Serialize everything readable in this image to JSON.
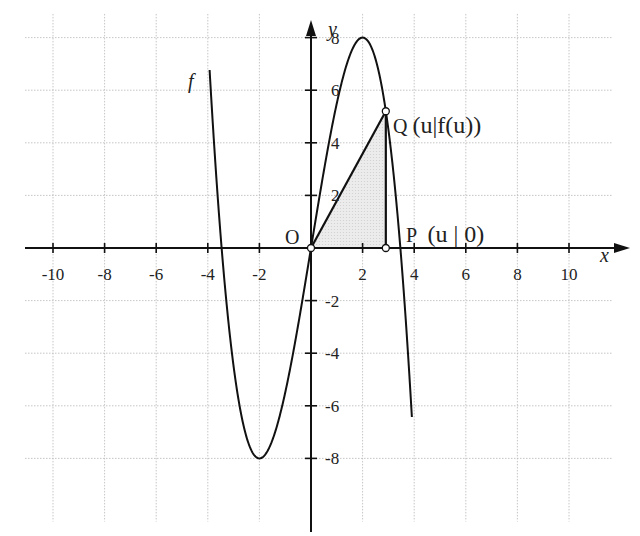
{
  "chart_data": {
    "type": "line",
    "title": "",
    "function_label": "f",
    "function_formula": "f(x) = -0.5x^3 + 6x",
    "xlabel": "x",
    "ylabel": "y",
    "xlim": [
      -11.5,
      11.5
    ],
    "ylim": [
      -10.5,
      9
    ],
    "grid": true,
    "x_ticks": [
      -10,
      -8,
      -6,
      -4,
      -2,
      2,
      4,
      6,
      8,
      10
    ],
    "y_ticks": [
      -8,
      -6,
      -4,
      -2,
      2,
      4,
      6,
      8
    ],
    "x_tick_labels": [
      "-10",
      "-8",
      "-6",
      "-4",
      "-2",
      "2",
      "4",
      "6",
      "8",
      "10"
    ],
    "y_tick_labels": [
      "-8",
      "-6",
      "-4",
      "-2",
      "2",
      "4",
      "6",
      "8"
    ],
    "series": [
      {
        "name": "f",
        "x": [
          -3.9,
          -3.46,
          -3,
          -2.5,
          -2,
          -1.5,
          -1,
          -0.5,
          0,
          0.5,
          1,
          1.5,
          2,
          2.5,
          3,
          3.46,
          3.9
        ],
        "values": [
          6.26,
          0,
          -4.5,
          -7.19,
          -8,
          -6.31,
          -5.5,
          -2.94,
          0,
          2.94,
          5.5,
          7.31,
          8,
          7.19,
          4.5,
          0,
          -6.26
        ]
      }
    ],
    "extrema": {
      "local_max": [
        2,
        8
      ],
      "local_min": [
        -2,
        -8
      ]
    },
    "points": [
      {
        "name": "O",
        "label": "O",
        "x": 0,
        "y": 0
      },
      {
        "name": "P",
        "label": "P (u | 0)",
        "x": 2.9,
        "y": 0
      },
      {
        "name": "Q",
        "label": "Q(u|f(u))",
        "x": 2.9,
        "y": 5.2
      }
    ],
    "shaded_region": {
      "type": "triangle",
      "vertices": [
        "O",
        "P",
        "Q"
      ],
      "fill": "#e6e6e6"
    },
    "annotations": [
      "f",
      "O",
      "P (u | 0)",
      "Q(u|f(u))"
    ]
  },
  "labels": {
    "x_axis": "x",
    "y_axis": "y",
    "function": "f",
    "origin": "O",
    "point_p_letter": "P",
    "point_p_coords": "(u | 0)",
    "point_q_letter": "Q",
    "point_q_coords": "(u|f(u))",
    "top_cut_text": "Q(u|f(u)) ... tangent ... area"
  },
  "colors": {
    "curve": "#111111",
    "axis": "#111111",
    "grid": "#b8b8b8",
    "shade": "#e4e4e4"
  }
}
